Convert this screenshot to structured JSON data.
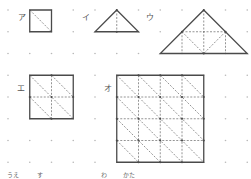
{
  "figure": {
    "grid": {
      "columns": 12,
      "rows": 8
    },
    "shapes": [
      {
        "id": "a",
        "label": "ア",
        "type": "square",
        "outline": [
          [
            1,
            0
          ],
          [
            2,
            0
          ],
          [
            2,
            1
          ],
          [
            1,
            1
          ]
        ],
        "dashed": [
          [
            [
              1,
              0
            ],
            [
              2,
              1
            ]
          ]
        ],
        "vertices": []
      },
      {
        "id": "i",
        "label": "イ",
        "type": "triangle",
        "outline": [
          [
            5,
            0
          ],
          [
            6,
            1
          ],
          [
            4,
            1
          ]
        ],
        "dashed": [
          [
            [
              5,
              0
            ],
            [
              5,
              1
            ]
          ]
        ],
        "vertices": [
          [
            5,
            0
          ],
          [
            5,
            1
          ]
        ]
      },
      {
        "id": "u",
        "label": "ウ",
        "type": "triangle",
        "outline": [
          [
            9,
            0
          ],
          [
            11,
            2
          ],
          [
            7,
            2
          ]
        ],
        "dashed": [
          [
            [
              8,
              1
            ],
            [
              10,
              1
            ]
          ],
          [
            [
              8,
              1
            ],
            [
              8,
              2
            ]
          ],
          [
            [
              9,
              0
            ],
            [
              9,
              2
            ]
          ],
          [
            [
              10,
              1
            ],
            [
              10,
              2
            ]
          ],
          [
            [
              8,
              1
            ],
            [
              9,
              2
            ]
          ],
          [
            [
              10,
              1
            ],
            [
              9,
              2
            ]
          ]
        ],
        "vertices": [
          [
            9,
            0
          ],
          [
            8,
            1
          ],
          [
            10,
            1
          ],
          [
            9,
            2
          ]
        ]
      },
      {
        "id": "e",
        "label": "エ",
        "type": "square",
        "outline": [
          [
            1,
            3
          ],
          [
            3,
            3
          ],
          [
            3,
            5
          ],
          [
            1,
            5
          ]
        ],
        "dashed": [
          [
            [
              2,
              3
            ],
            [
              2,
              5
            ]
          ],
          [
            [
              1,
              4
            ],
            [
              3,
              4
            ]
          ],
          [
            [
              1,
              3
            ],
            [
              3,
              5
            ]
          ],
          [
            [
              2,
              3
            ],
            [
              3,
              4
            ]
          ],
          [
            [
              1,
              4
            ],
            [
              2,
              5
            ]
          ]
        ],
        "vertices": [
          [
            2,
            3
          ],
          [
            1,
            4
          ],
          [
            3,
            4
          ],
          [
            2,
            5
          ],
          [
            2,
            4
          ]
        ]
      },
      {
        "id": "o",
        "label": "オ",
        "type": "square",
        "outline": [
          [
            5,
            3
          ],
          [
            9,
            3
          ],
          [
            9,
            7
          ],
          [
            5,
            7
          ]
        ],
        "dashed": [
          [
            [
              6,
              3
            ],
            [
              6,
              7
            ]
          ],
          [
            [
              7,
              3
            ],
            [
              7,
              7
            ]
          ],
          [
            [
              8,
              3
            ],
            [
              8,
              7
            ]
          ],
          [
            [
              5,
              4
            ],
            [
              9,
              4
            ]
          ],
          [
            [
              5,
              5
            ],
            [
              9,
              5
            ]
          ],
          [
            [
              5,
              6
            ],
            [
              9,
              6
            ]
          ],
          [
            [
              5,
              3
            ],
            [
              9,
              7
            ]
          ],
          [
            [
              6,
              3
            ],
            [
              9,
              6
            ]
          ],
          [
            [
              7,
              3
            ],
            [
              9,
              5
            ]
          ],
          [
            [
              8,
              3
            ],
            [
              9,
              4
            ]
          ],
          [
            [
              5,
              4
            ],
            [
              8,
              7
            ]
          ],
          [
            [
              5,
              5
            ],
            [
              7,
              7
            ]
          ],
          [
            [
              5,
              6
            ],
            [
              6,
              7
            ]
          ]
        ],
        "vertices": [
          [
            6,
            3
          ],
          [
            7,
            3
          ],
          [
            8,
            3
          ],
          [
            5,
            4
          ],
          [
            5,
            5
          ],
          [
            5,
            6
          ],
          [
            9,
            4
          ],
          [
            9,
            5
          ],
          [
            9,
            6
          ],
          [
            6,
            7
          ],
          [
            7,
            7
          ],
          [
            8,
            7
          ],
          [
            6,
            4
          ],
          [
            7,
            4
          ],
          [
            8,
            4
          ],
          [
            6,
            5
          ],
          [
            7,
            5
          ],
          [
            8,
            5
          ],
          [
            6,
            6
          ],
          [
            7,
            6
          ],
          [
            8,
            6
          ]
        ]
      }
    ],
    "footer_text": [
      {
        "id": "ue",
        "text": "うえ"
      },
      {
        "id": "su",
        "text": "す"
      },
      {
        "id": "wa",
        "text": "わ"
      },
      {
        "id": "kata",
        "text": "かた"
      }
    ]
  }
}
